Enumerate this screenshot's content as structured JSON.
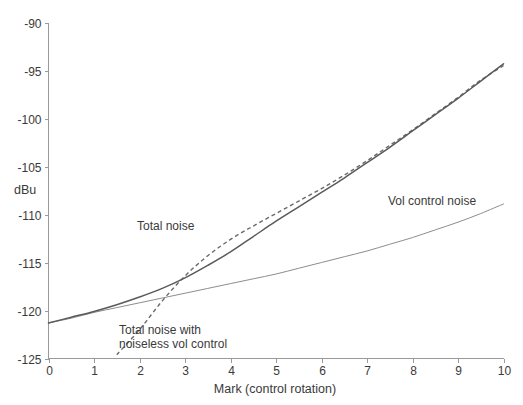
{
  "chart_data": {
    "type": "line",
    "title": "",
    "xlabel": "Mark  (control rotation)",
    "ylabel": "dBu",
    "xlim": [
      0,
      10
    ],
    "ylim": [
      -125,
      -90
    ],
    "grid": false,
    "legend_position": "inline-annotations",
    "xticks": [
      "0",
      "1",
      "2",
      "3",
      "4",
      "5",
      "6",
      "7",
      "8",
      "9",
      "10"
    ],
    "xtick_values": [
      0,
      1,
      2,
      3,
      4,
      5,
      6,
      7,
      8,
      9,
      10
    ],
    "yticks": [
      "-90",
      "-95",
      "-100",
      "-105",
      "-110",
      "-115",
      "-120",
      "-125"
    ],
    "ytick_values": [
      -90,
      -95,
      -100,
      -105,
      -110,
      -115,
      -120,
      -125
    ],
    "x": [
      0,
      0.5,
      1,
      1.5,
      2,
      2.5,
      3,
      3.5,
      4,
      4.5,
      5,
      5.5,
      6,
      6.5,
      7,
      7.5,
      8,
      8.5,
      9,
      9.5,
      10
    ],
    "series": [
      {
        "name": "Total noise",
        "style": "solid",
        "color": "#5a5a5a",
        "label_x": 2.0,
        "label_y": -111.2,
        "values": [
          -121.3,
          -120.7,
          -120.1,
          -119.4,
          -118.6,
          -117.7,
          -116.6,
          -115.3,
          -113.9,
          -112.3,
          -110.7,
          -109.2,
          -107.7,
          -106.2,
          -104.6,
          -103.0,
          -101.3,
          -99.6,
          -97.9,
          -96.1,
          -94.3
        ]
      },
      {
        "name": "Total noise with noiseless vol control",
        "style": "dashed",
        "color": "#6a6a6a",
        "label_x": 1.5,
        "label_y": -122.1,
        "values": [
          null,
          null,
          null,
          -124.6,
          -122.0,
          -119.0,
          -116.4,
          -114.3,
          -112.6,
          -111.2,
          -109.9,
          -108.6,
          -107.3,
          -105.9,
          -104.4,
          -102.8,
          -101.2,
          -99.5,
          -97.8,
          -96.0,
          -94.5
        ]
      },
      {
        "name": "Vol control noise",
        "style": "thin-solid",
        "color": "#8d8d8d",
        "label_x": 7.3,
        "label_y": -109.5,
        "values": [
          -121.3,
          -120.8,
          -120.2,
          -119.7,
          -119.2,
          -118.7,
          -118.2,
          -117.7,
          -117.2,
          -116.7,
          -116.2,
          -115.6,
          -115.0,
          -114.4,
          -113.8,
          -113.1,
          -112.4,
          -111.6,
          -110.8,
          -109.9,
          -108.9
        ]
      }
    ],
    "annotations": [
      {
        "id": "total-noise-label",
        "text": "Total noise",
        "x_px": 137,
        "y_px": 230
      },
      {
        "id": "noiseless-label-line1",
        "text": "Total noise with",
        "x_px": 119,
        "y_px": 334
      },
      {
        "id": "noiseless-label-line2",
        "text": "noiseless vol control",
        "x_px": 119,
        "y_px": 348
      },
      {
        "id": "vol-control-label",
        "text": "Vol control noise",
        "x_px": 388,
        "y_px": 205
      }
    ]
  },
  "axes": {
    "y_axis_title": "dBu",
    "x_axis_title": "Mark  (control rotation)"
  },
  "colors": {
    "background": "#ffffff",
    "axis": "#9a9a9a",
    "text": "#3a3a3a",
    "total_noise": "#5a5a5a",
    "noiseless": "#6a6a6a",
    "vol_control": "#8d8d8d"
  }
}
